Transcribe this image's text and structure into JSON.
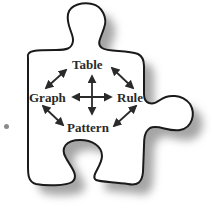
{
  "diagram": {
    "shape": "puzzle-piece",
    "nodes": {
      "top": "Table",
      "left": "Graph",
      "right": "Rule",
      "bottom": "Pattern"
    },
    "connections": [
      {
        "from": "Table",
        "to": "Rule",
        "type": "bidirectional"
      },
      {
        "from": "Rule",
        "to": "Pattern",
        "type": "bidirectional"
      },
      {
        "from": "Pattern",
        "to": "Graph",
        "type": "bidirectional"
      },
      {
        "from": "Graph",
        "to": "Table",
        "type": "bidirectional"
      },
      {
        "from": "Table",
        "to": "Pattern",
        "type": "bidirectional"
      },
      {
        "from": "Graph",
        "to": "Rule",
        "type": "bidirectional"
      }
    ],
    "colors": {
      "outline": "#1a1a1a",
      "shadow": "#9a9a9a",
      "text": "#2a2a2a",
      "arrow": "#2a2a2a",
      "bullet": "#8a8a8a"
    }
  }
}
